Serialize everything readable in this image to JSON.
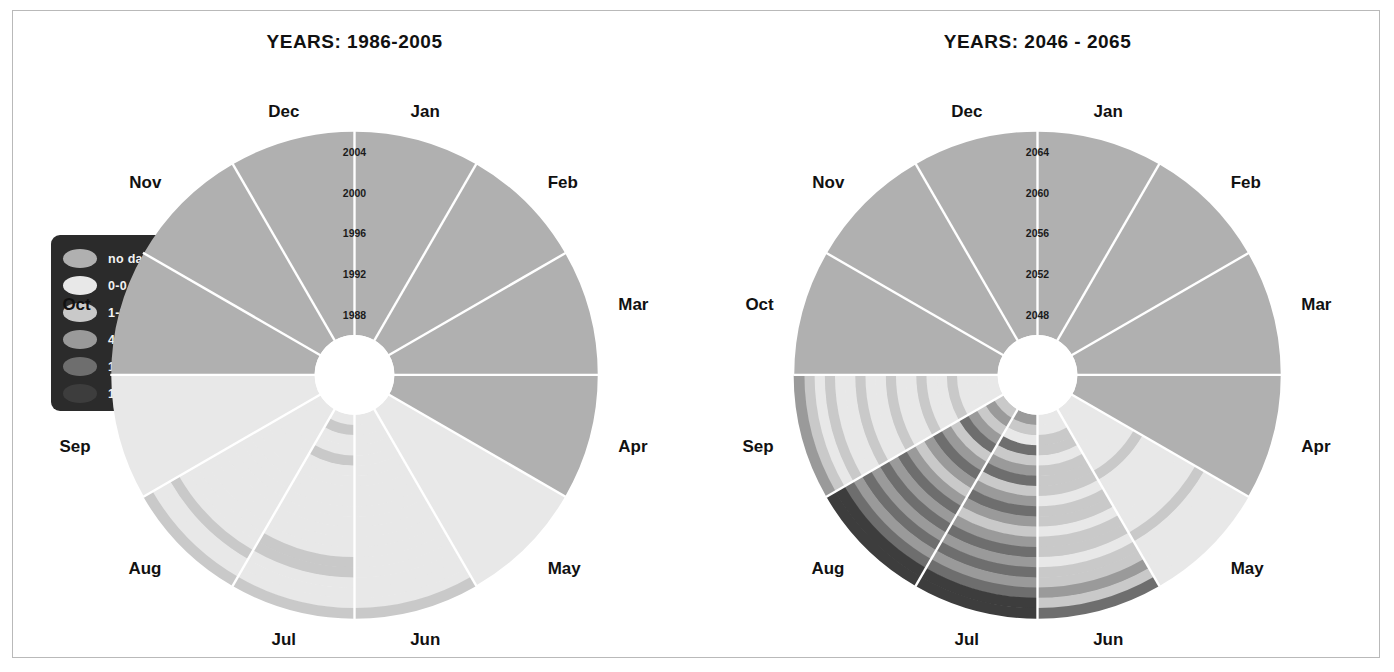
{
  "figure": {
    "background": "#ffffff",
    "frame_border": "#b9b9b9"
  },
  "legend": {
    "name": "color-legend",
    "background": "#2b2b2b",
    "items": [
      {
        "label": "no data",
        "color": "#b0b0b0"
      },
      {
        "label": "0-0",
        "color": "#e8e8e8"
      },
      {
        "label": "1-3",
        "color": "#c9c9c9"
      },
      {
        "label": "4-9",
        "color": "#9a9a9a"
      },
      {
        "label": "10-14",
        "color": "#6e6e6e"
      },
      {
        "label": "15-25",
        "color": "#3d3d3d"
      }
    ]
  },
  "months": [
    "Jan",
    "Feb",
    "Mar",
    "Apr",
    "May",
    "Jun",
    "Jul",
    "Aug",
    "Sep",
    "Oct",
    "Nov",
    "Dec"
  ],
  "chart_data": [
    {
      "type": "heatmap",
      "subtype": "polar-year-month-heatmap",
      "title": "YEARS: 1986-2005",
      "panel": "left",
      "categories": [
        "Jan",
        "Feb",
        "Mar",
        "Apr",
        "May",
        "Jun",
        "Jul",
        "Aug",
        "Sep",
        "Oct",
        "Nov",
        "Dec"
      ],
      "radial_axis": {
        "label": "year",
        "ticks": [
          "1988",
          "1992",
          "1996",
          "2000",
          "2004"
        ],
        "range": [
          1986,
          2005
        ],
        "direction": "inner-to-outer"
      },
      "legend_bins": [
        "no data",
        "0-0",
        "1-3",
        "4-9",
        "10-14",
        "15-25"
      ],
      "grid": true,
      "values": {
        "Jan": [
          "nd",
          "nd",
          "nd",
          "nd",
          "nd",
          "nd",
          "nd",
          "nd",
          "nd",
          "nd",
          "nd",
          "nd",
          "nd",
          "nd",
          "nd",
          "nd",
          "nd",
          "nd",
          "nd",
          "nd"
        ],
        "Feb": [
          "nd",
          "nd",
          "nd",
          "nd",
          "nd",
          "nd",
          "nd",
          "nd",
          "nd",
          "nd",
          "nd",
          "nd",
          "nd",
          "nd",
          "nd",
          "nd",
          "nd",
          "nd",
          "nd",
          "nd"
        ],
        "Mar": [
          "nd",
          "nd",
          "nd",
          "nd",
          "nd",
          "nd",
          "nd",
          "nd",
          "nd",
          "nd",
          "nd",
          "nd",
          "nd",
          "nd",
          "nd",
          "nd",
          "nd",
          "nd",
          "nd",
          "nd"
        ],
        "Apr": [
          "nd",
          "nd",
          "nd",
          "nd",
          "nd",
          "nd",
          "nd",
          "nd",
          "nd",
          "nd",
          "nd",
          "nd",
          "nd",
          "nd",
          "nd",
          "nd",
          "nd",
          "nd",
          "nd",
          "nd"
        ],
        "May": [
          "0",
          "0",
          "0",
          "0",
          "0",
          "0",
          "0",
          "0",
          "0",
          "0",
          "0",
          "0",
          "0",
          "0",
          "0",
          "0",
          "0",
          "0",
          "0",
          "0"
        ],
        "Jun": [
          "0",
          "0",
          "0",
          "0",
          "0",
          "0",
          "0",
          "0",
          "0",
          "0",
          "0",
          "0",
          "0",
          "0",
          "0",
          "0",
          "0",
          "0",
          "0",
          "1-3"
        ],
        "Jul": [
          "0",
          "1-3",
          "0",
          "0",
          "1-3",
          "0",
          "0",
          "0",
          "0",
          "0",
          "0",
          "0",
          "0",
          "0",
          "1-3",
          "1-3",
          "0",
          "0",
          "0",
          "1-3"
        ],
        "Aug": [
          "0",
          "0",
          "0",
          "0",
          "0",
          "0",
          "0",
          "0",
          "0",
          "0",
          "0",
          "0",
          "0",
          "0",
          "0",
          "0",
          "1-3",
          "0",
          "0",
          "1-3"
        ],
        "Sep": [
          "0",
          "0",
          "0",
          "0",
          "0",
          "0",
          "0",
          "0",
          "0",
          "0",
          "0",
          "0",
          "0",
          "0",
          "0",
          "0",
          "0",
          "0",
          "0",
          "0"
        ],
        "Oct": [
          "nd",
          "nd",
          "nd",
          "nd",
          "nd",
          "nd",
          "nd",
          "nd",
          "nd",
          "nd",
          "nd",
          "nd",
          "nd",
          "nd",
          "nd",
          "nd",
          "nd",
          "nd",
          "nd",
          "nd"
        ],
        "Nov": [
          "nd",
          "nd",
          "nd",
          "nd",
          "nd",
          "nd",
          "nd",
          "nd",
          "nd",
          "nd",
          "nd",
          "nd",
          "nd",
          "nd",
          "nd",
          "nd",
          "nd",
          "nd",
          "nd",
          "nd"
        ],
        "Dec": [
          "nd",
          "nd",
          "nd",
          "nd",
          "nd",
          "nd",
          "nd",
          "nd",
          "nd",
          "nd",
          "nd",
          "nd",
          "nd",
          "nd",
          "nd",
          "nd",
          "nd",
          "nd",
          "nd",
          "nd"
        ]
      }
    },
    {
      "type": "heatmap",
      "subtype": "polar-year-month-heatmap",
      "title": "YEARS: 2046 - 2065",
      "panel": "right",
      "categories": [
        "Jan",
        "Feb",
        "Mar",
        "Apr",
        "May",
        "Jun",
        "Jul",
        "Aug",
        "Sep",
        "Oct",
        "Nov",
        "Dec"
      ],
      "radial_axis": {
        "label": "year",
        "ticks": [
          "2048",
          "2052",
          "2056",
          "2060",
          "2064"
        ],
        "range": [
          2046,
          2065
        ],
        "direction": "inner-to-outer"
      },
      "legend_bins": [
        "no data",
        "0-0",
        "1-3",
        "4-9",
        "10-14",
        "15-25"
      ],
      "grid": true,
      "values": {
        "Jan": [
          "nd",
          "nd",
          "nd",
          "nd",
          "nd",
          "nd",
          "nd",
          "nd",
          "nd",
          "nd",
          "nd",
          "nd",
          "nd",
          "nd",
          "nd",
          "nd",
          "nd",
          "nd",
          "nd",
          "nd"
        ],
        "Feb": [
          "nd",
          "nd",
          "nd",
          "nd",
          "nd",
          "nd",
          "nd",
          "nd",
          "nd",
          "nd",
          "nd",
          "nd",
          "nd",
          "nd",
          "nd",
          "nd",
          "nd",
          "nd",
          "nd",
          "nd"
        ],
        "Mar": [
          "nd",
          "nd",
          "nd",
          "nd",
          "nd",
          "nd",
          "nd",
          "nd",
          "nd",
          "nd",
          "nd",
          "nd",
          "nd",
          "nd",
          "nd",
          "nd",
          "nd",
          "nd",
          "nd",
          "nd"
        ],
        "Apr": [
          "nd",
          "nd",
          "nd",
          "nd",
          "nd",
          "nd",
          "nd",
          "nd",
          "nd",
          "nd",
          "nd",
          "nd",
          "nd",
          "nd",
          "nd",
          "nd",
          "nd",
          "nd",
          "nd",
          "nd"
        ],
        "May": [
          "0",
          "0",
          "0",
          "0",
          "0",
          "0",
          "0",
          "1-3",
          "0",
          "0",
          "0",
          "0",
          "0",
          "0",
          "1-3",
          "0",
          "0",
          "0",
          "0",
          "0"
        ],
        "Jun": [
          "0",
          "0",
          "1-3",
          "1-3",
          "0",
          "1-3",
          "1-3",
          "1-3",
          "0",
          "1-3",
          "1-3",
          "0",
          "1-3",
          "1-3",
          "0",
          "1-3",
          "1-3",
          "4-9",
          "1-3",
          "10-14"
        ],
        "Jul": [
          "4-9",
          "1-3",
          "0",
          "10-14",
          "1-3",
          "4-9",
          "10-14",
          "1-3",
          "4-9",
          "10-14",
          "4-9",
          "1-3",
          "4-9",
          "10-14",
          "4-9",
          "10-14",
          "4-9",
          "10-14",
          "15-25",
          "15-25"
        ],
        "Aug": [
          "1-3",
          "4-9",
          "1-3",
          "4-9",
          "10-14",
          "1-3",
          "4-9",
          "10-14",
          "4-9",
          "1-3",
          "4-9",
          "10-14",
          "4-9",
          "10-14",
          "4-9",
          "10-14",
          "4-9",
          "10-14",
          "15-25",
          "15-25"
        ],
        "Sep": [
          "0",
          "0",
          "0",
          "0",
          "1-3",
          "0",
          "0",
          "1-3",
          "0",
          "0",
          "1-3",
          "0",
          "0",
          "1-3",
          "0",
          "0",
          "1-3",
          "0",
          "1-3",
          "4-9"
        ],
        "Oct": [
          "nd",
          "nd",
          "nd",
          "nd",
          "nd",
          "nd",
          "nd",
          "nd",
          "nd",
          "nd",
          "nd",
          "nd",
          "nd",
          "nd",
          "nd",
          "nd",
          "nd",
          "nd",
          "nd",
          "nd"
        ],
        "Nov": [
          "nd",
          "nd",
          "nd",
          "nd",
          "nd",
          "nd",
          "nd",
          "nd",
          "nd",
          "nd",
          "nd",
          "nd",
          "nd",
          "nd",
          "nd",
          "nd",
          "nd",
          "nd",
          "nd",
          "nd"
        ],
        "Dec": [
          "nd",
          "nd",
          "nd",
          "nd",
          "nd",
          "nd",
          "nd",
          "nd",
          "nd",
          "nd",
          "nd",
          "nd",
          "nd",
          "nd",
          "nd",
          "nd",
          "nd",
          "nd",
          "nd",
          "nd"
        ]
      }
    }
  ],
  "geometry": {
    "center_x": 342,
    "center_y": 365,
    "inner_radius": 40,
    "outer_radius": 244,
    "gap_degrees": 1.0
  }
}
